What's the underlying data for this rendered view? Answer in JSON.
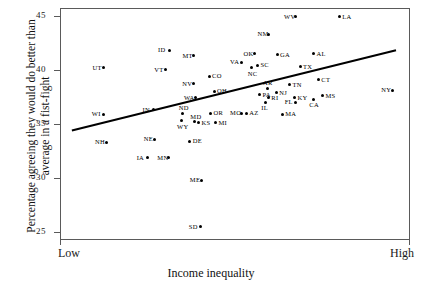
{
  "chart_data": {
    "type": "scatter",
    "title": "",
    "xlabel": "Income inequality",
    "ylabel_line1": "Percentage agreeing they would do better than",
    "ylabel_line2": "average in a fist-fight",
    "x_tick_labels": [
      "Low",
      "High"
    ],
    "y_tick_labels": [
      "25",
      "30",
      "35",
      "40",
      "45"
    ],
    "y_ticks": [
      25,
      30,
      35,
      40,
      45
    ],
    "ylim": [
      24.3,
      45.7
    ],
    "xlim": [
      0,
      100
    ],
    "grid": false,
    "legend": "none",
    "point_label_field": "label",
    "annotations": [
      "trend line (positive slope)"
    ],
    "trendline": {
      "x0": 3.4,
      "y0": 34.4,
      "x1": 96.0,
      "y1": 41.8
    },
    "points": [
      {
        "label": "UT",
        "x": 12.5,
        "y": 40.2,
        "lpos": "left"
      },
      {
        "label": "WI",
        "x": 12.3,
        "y": 35.9,
        "lpos": "left"
      },
      {
        "label": "NH",
        "x": 13.2,
        "y": 33.3,
        "lpos": "left"
      },
      {
        "label": "ID",
        "x": 31.2,
        "y": 41.8,
        "lpos": "left"
      },
      {
        "label": "VT",
        "x": 30.1,
        "y": 40.0,
        "lpos": "left"
      },
      {
        "label": "IN",
        "x": 26.8,
        "y": 36.3,
        "lpos": "left"
      },
      {
        "label": "NE",
        "x": 27.1,
        "y": 33.6,
        "lpos": "left"
      },
      {
        "label": "IA",
        "x": 25.1,
        "y": 31.9,
        "lpos": "left"
      },
      {
        "label": "MN",
        "x": 31.0,
        "y": 31.9,
        "lpos": "left"
      },
      {
        "label": "MT",
        "x": 38.2,
        "y": 41.3,
        "lpos": "left"
      },
      {
        "label": "NV",
        "x": 38.1,
        "y": 38.7,
        "lpos": "left"
      },
      {
        "label": "WA",
        "x": 38.6,
        "y": 37.4,
        "lpos": "left"
      },
      {
        "label": "ND",
        "x": 35.1,
        "y": 36.0,
        "lpos": "above"
      },
      {
        "label": "WY",
        "x": 34.6,
        "y": 35.3,
        "lpos": "below"
      },
      {
        "label": "MD",
        "x": 38.4,
        "y": 35.2,
        "lpos": "above"
      },
      {
        "label": "KS",
        "x": 39.6,
        "y": 35.1,
        "lpos": "right"
      },
      {
        "label": "DE",
        "x": 37.1,
        "y": 33.4,
        "lpos": "right"
      },
      {
        "label": "ME",
        "x": 40.3,
        "y": 29.8,
        "lpos": "left"
      },
      {
        "label": "SD",
        "x": 40.0,
        "y": 25.5,
        "lpos": "left"
      },
      {
        "label": "CO",
        "x": 42.6,
        "y": 39.4,
        "lpos": "right"
      },
      {
        "label": "OH",
        "x": 44.0,
        "y": 38.0,
        "lpos": "right"
      },
      {
        "label": "OR",
        "x": 43.0,
        "y": 36.0,
        "lpos": "right"
      },
      {
        "label": "MI",
        "x": 44.4,
        "y": 35.1,
        "lpos": "right"
      },
      {
        "label": "MO",
        "x": 51.8,
        "y": 36.0,
        "lpos": "left"
      },
      {
        "label": "AZ",
        "x": 53.2,
        "y": 36.0,
        "lpos": "right"
      },
      {
        "label": "VA",
        "x": 51.8,
        "y": 40.7,
        "lpos": "left"
      },
      {
        "label": "OK",
        "x": 55.6,
        "y": 41.5,
        "lpos": "left"
      },
      {
        "label": "SC",
        "x": 56.4,
        "y": 40.4,
        "lpos": "right"
      },
      {
        "label": "NC",
        "x": 54.8,
        "y": 40.2,
        "lpos": "below"
      },
      {
        "label": "NM",
        "x": 59.6,
        "y": 43.3,
        "lpos": "left"
      },
      {
        "label": "GA",
        "x": 62.0,
        "y": 41.4,
        "lpos": "right"
      },
      {
        "label": "AR",
        "x": 59.2,
        "y": 38.3,
        "lpos": "above"
      },
      {
        "label": "PA",
        "x": 57.0,
        "y": 37.7,
        "lpos": "right"
      },
      {
        "label": "RI",
        "x": 59.5,
        "y": 37.4,
        "lpos": "right"
      },
      {
        "label": "IL",
        "x": 58.7,
        "y": 37.0,
        "lpos": "below"
      },
      {
        "label": "NJ",
        "x": 61.8,
        "y": 37.9,
        "lpos": "right"
      },
      {
        "label": "MA",
        "x": 63.5,
        "y": 35.9,
        "lpos": "right"
      },
      {
        "label": "WV",
        "x": 67.2,
        "y": 44.9,
        "lpos": "left"
      },
      {
        "label": "TN",
        "x": 65.6,
        "y": 38.6,
        "lpos": "right"
      },
      {
        "label": "KY",
        "x": 67.0,
        "y": 37.4,
        "lpos": "right"
      },
      {
        "label": "FL",
        "x": 67.4,
        "y": 37.0,
        "lpos": "left"
      },
      {
        "label": "TX",
        "x": 68.6,
        "y": 40.3,
        "lpos": "right"
      },
      {
        "label": "AL",
        "x": 72.4,
        "y": 41.5,
        "lpos": "right"
      },
      {
        "label": "CT",
        "x": 73.8,
        "y": 39.1,
        "lpos": "right"
      },
      {
        "label": "MS",
        "x": 75.0,
        "y": 37.6,
        "lpos": "right"
      },
      {
        "label": "CA",
        "x": 72.4,
        "y": 37.3,
        "lpos": "below"
      },
      {
        "label": "LA",
        "x": 79.8,
        "y": 44.9,
        "lpos": "right"
      },
      {
        "label": "NY",
        "x": 95.0,
        "y": 38.1,
        "lpos": "left"
      }
    ]
  }
}
